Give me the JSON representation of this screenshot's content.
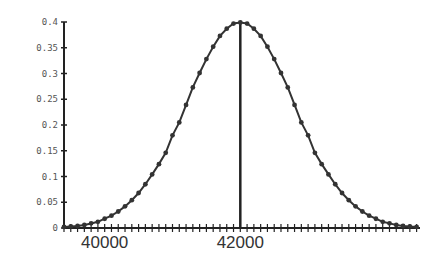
{
  "chart_data": {
    "type": "line",
    "title": "",
    "xlabel": "",
    "ylabel": "",
    "xlim": [
      39400,
      44650
    ],
    "ylim": [
      0,
      0.4
    ],
    "grid": false,
    "legend": null,
    "mean": 42000,
    "std_estimate": 800,
    "x_tick_labels": [
      {
        "value": 40000,
        "label": "40000"
      },
      {
        "value": 42000,
        "label": "42000"
      }
    ],
    "y_tick_labels": [
      {
        "value": 0,
        "label": "0"
      },
      {
        "value": 0.05,
        "label": "0.05"
      },
      {
        "value": 0.1,
        "label": "0.1"
      },
      {
        "value": 0.15,
        "label": "0.15"
      },
      {
        "value": 0.2,
        "label": "0.2"
      },
      {
        "value": 0.25,
        "label": "0.25"
      },
      {
        "value": 0.3,
        "label": "0.3"
      },
      {
        "value": 0.35,
        "label": "0.35"
      },
      {
        "value": 0.4,
        "label": "0.4"
      }
    ],
    "x_minor_tick_step": 100,
    "annotations": [
      {
        "type": "vertical-line",
        "x": 42000,
        "y_from": 0,
        "y_to": 0.4
      }
    ],
    "series": [
      {
        "name": "normal-density",
        "marker": "circle",
        "color": "#333333",
        "x": [
          39400,
          39500,
          39600,
          39700,
          39800,
          39900,
          40000,
          40100,
          40200,
          40300,
          40400,
          40500,
          40600,
          40700,
          40800,
          40900,
          41000,
          41100,
          41200,
          41300,
          41400,
          41500,
          41600,
          41700,
          41800,
          41900,
          42000,
          42100,
          42200,
          42300,
          42400,
          42500,
          42600,
          42700,
          42800,
          42900,
          43000,
          43100,
          43200,
          43300,
          43400,
          43500,
          43600,
          43700,
          43800,
          43900,
          44000,
          44100,
          44200,
          44300,
          44400,
          44500,
          44600
        ],
        "values": [
          0.002,
          0.003,
          0.004,
          0.006,
          0.009,
          0.012,
          0.018,
          0.024,
          0.032,
          0.042,
          0.054,
          0.068,
          0.085,
          0.104,
          0.124,
          0.146,
          0.18,
          0.205,
          0.239,
          0.273,
          0.301,
          0.328,
          0.352,
          0.373,
          0.387,
          0.397,
          0.399,
          0.397,
          0.387,
          0.373,
          0.352,
          0.328,
          0.301,
          0.273,
          0.239,
          0.205,
          0.18,
          0.146,
          0.124,
          0.104,
          0.085,
          0.068,
          0.054,
          0.042,
          0.032,
          0.024,
          0.018,
          0.012,
          0.009,
          0.006,
          0.004,
          0.003,
          0.002
        ]
      }
    ]
  },
  "colors": {
    "axis": "#222222",
    "line": "#333333",
    "marker": "#333333",
    "background": "#ffffff"
  }
}
